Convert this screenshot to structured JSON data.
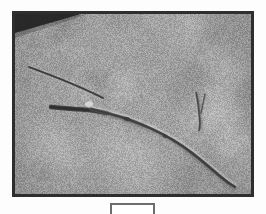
{
  "figure": {
    "kind": "photograph",
    "page_background": "#fdfdfd"
  },
  "photo": {
    "name": "specimen-photograph",
    "border_color": "#2e2e2e",
    "border_width_px": 3,
    "background_color": "#9b9b9b",
    "texture": {
      "description": "fine granular mottled gray noise",
      "base_color": "#9b9b9b",
      "light_color": "#bdbdbd",
      "dark_color": "#7c7c7c",
      "grain": "fine"
    },
    "frame": {
      "x": 12,
      "y": 11,
      "width": 242,
      "height": 186
    },
    "corner_shadow": {
      "name": "top-left-dark-wedge",
      "color": "#1f1f1f",
      "description": "dark triangular shadow wedge in the upper-left interior corner"
    },
    "subjects": [
      {
        "name": "main-filament",
        "description": "long slender dark twig-like filament running from upper-left to lower-right with a gentle downward curve",
        "color": "#4a4a4a",
        "highlight_color": "#d2d2d2"
      },
      {
        "name": "thick-mid-segment",
        "description": "short thicker darker segment overlapping the filament near the left-centre",
        "color": "#3a3a3a"
      },
      {
        "name": "side-fragment",
        "description": "small separate forked vertical fragment on the right side above the main filament",
        "color": "#5a5a5a"
      }
    ]
  },
  "scale_bar": {
    "name": "scale-bar-box",
    "label": "",
    "border_color": "#6d6d6d",
    "x": 110,
    "y": 203,
    "width": 45,
    "height": 16
  }
}
